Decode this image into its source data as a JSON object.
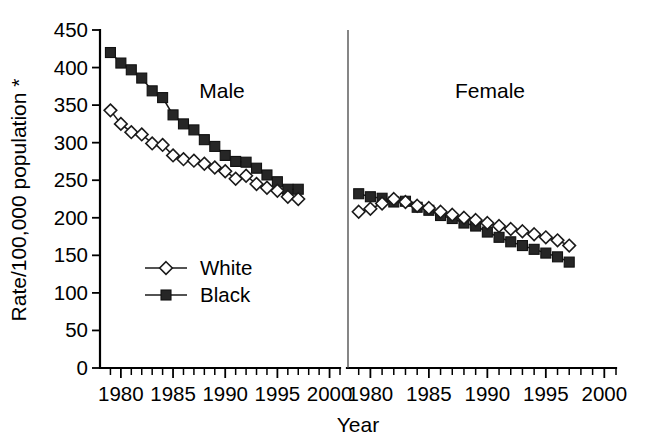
{
  "chart_data": {
    "type": "line",
    "title": "",
    "xlabel": "Year",
    "ylabel": "Rate/100,000 population *",
    "ylim": [
      0,
      450
    ],
    "ytick_step": 50,
    "yticks": [
      0,
      50,
      100,
      150,
      200,
      250,
      300,
      350,
      400,
      450
    ],
    "ytick_labels": [
      "0",
      "50",
      "100",
      "150",
      "200",
      "250",
      "300",
      "350",
      "400",
      "450"
    ],
    "xlim": [
      1978,
      2001
    ],
    "xticks": [
      1980,
      1985,
      1990,
      1995,
      2000
    ],
    "xtick_labels": [
      "1980",
      "1985",
      "1990",
      "1995",
      "2000"
    ],
    "xtick_minor_step": 1,
    "grid": false,
    "legend_position": "inside-lower-left",
    "legend_entries": [
      "White",
      "Black"
    ],
    "markers": {
      "White": "open-diamond",
      "Black": "filled-square"
    },
    "colors": {
      "White": "#ffffff",
      "Black": "#262626",
      "line": "#1a1a1a",
      "axis": "#000000"
    },
    "panels": [
      {
        "name": "Male",
        "label": "Male",
        "x": [
          1979,
          1980,
          1981,
          1982,
          1983,
          1984,
          1985,
          1986,
          1987,
          1988,
          1989,
          1990,
          1991,
          1992,
          1993,
          1994,
          1995,
          1996,
          1997
        ],
        "series": [
          {
            "name": "Black",
            "values": [
              420,
              406,
              397,
              386,
              369,
              360,
              337,
              325,
              317,
              304,
              295,
              283,
              275,
              274,
              266,
              257,
              248,
              238,
              238
            ]
          },
          {
            "name": "White",
            "values": [
              343,
              325,
              314,
              311,
              299,
              297,
              283,
              278,
              276,
              272,
              267,
              262,
              252,
              256,
              245,
              240,
              236,
              228,
              225
            ]
          }
        ]
      },
      {
        "name": "Female",
        "label": "Female",
        "x": [
          1979,
          1980,
          1981,
          1982,
          1983,
          1984,
          1985,
          1986,
          1987,
          1988,
          1989,
          1990,
          1991,
          1992,
          1993,
          1994,
          1995,
          1996,
          1997
        ],
        "series": [
          {
            "name": "Black",
            "values": [
              232,
              228,
              226,
              221,
              222,
              214,
              210,
              203,
              199,
              193,
              189,
              181,
              174,
              168,
              163,
              158,
              153,
              148,
              141
            ]
          },
          {
            "name": "White",
            "values": [
              208,
              212,
              219,
              225,
              221,
              216,
              213,
              208,
              204,
              200,
              197,
              193,
              189,
              185,
              182,
              178,
              174,
              170,
              163
            ]
          }
        ]
      }
    ]
  }
}
